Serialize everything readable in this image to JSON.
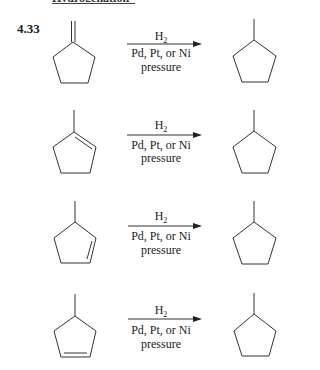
{
  "heading": {
    "text": "Hydrogenation"
  },
  "problem": {
    "number": "4.33"
  },
  "reactions": [
    {
      "reactant": "methylenecyclopentane",
      "reagent_main": "H",
      "reagent_sub": "2",
      "catalyst": "Pd, Pt, or Ni",
      "condition": "pressure",
      "product": "methylcyclopentane"
    },
    {
      "reactant": "1-methylcyclopentene",
      "reagent_main": "H",
      "reagent_sub": "2",
      "catalyst": "Pd, Pt, or Ni",
      "condition": "pressure",
      "product": "methylcyclopentane"
    },
    {
      "reactant": "3-methylcyclopentene",
      "reagent_main": "H",
      "reagent_sub": "2",
      "catalyst": "Pd, Pt, or Ni",
      "condition": "pressure",
      "product": "methylcyclopentane"
    },
    {
      "reactant": "4-methylcyclopentene",
      "reagent_main": "H",
      "reagent_sub": "2",
      "catalyst": "Pd, Pt, or Ni",
      "condition": "pressure",
      "product": "methylcyclopentane"
    }
  ],
  "colors": {
    "ink": "#222222",
    "background": "#ffffff"
  }
}
